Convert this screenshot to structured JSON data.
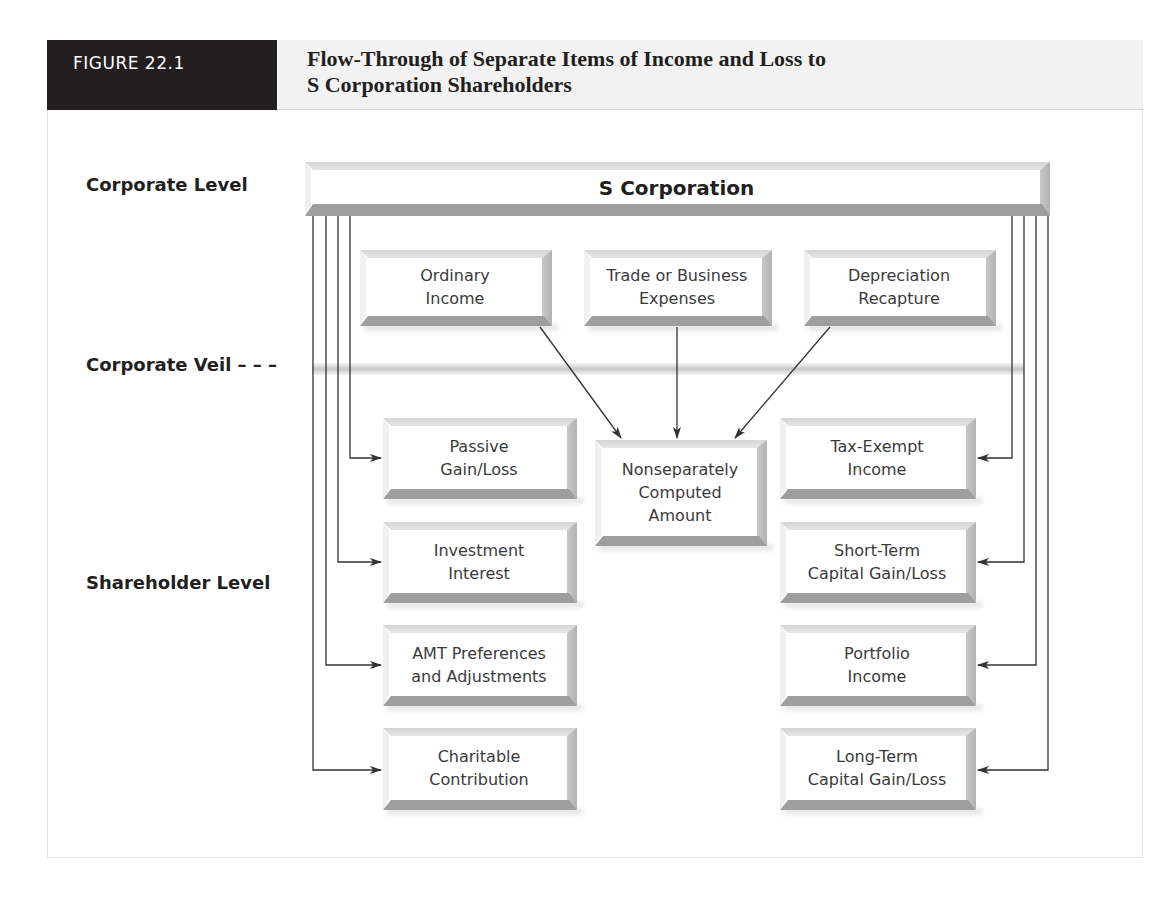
{
  "figure": {
    "label": "FIGURE 22.1",
    "title_line1": "Flow-Through of Separate Items of Income and Loss to",
    "title_line2": "S Corporation Shareholders"
  },
  "levels": {
    "corporate": "Corporate Level",
    "veil": "Corporate Veil – – –",
    "shareholder": "Shareholder Level"
  },
  "corporation": {
    "label": "S Corporation"
  },
  "top_items": [
    {
      "line1": "Ordinary",
      "line2": "Income"
    },
    {
      "line1": "Trade or Business",
      "line2": "Expenses"
    },
    {
      "line1": "Depreciation",
      "line2": "Recapture"
    }
  ],
  "center_item": {
    "line1": "Nonseparately",
    "line2": "Computed",
    "line3": "Amount"
  },
  "left_items": [
    {
      "line1": "Passive",
      "line2": "Gain/Loss"
    },
    {
      "line1": "Investment",
      "line2": "Interest"
    },
    {
      "line1": "AMT Preferences",
      "line2": "and Adjustments"
    },
    {
      "line1": "Charitable",
      "line2": "Contribution"
    }
  ],
  "right_items": [
    {
      "line1": "Tax-Exempt",
      "line2": "Income"
    },
    {
      "line1": "Short-Term",
      "line2": "Capital Gain/Loss"
    },
    {
      "line1": "Portfolio",
      "line2": "Income"
    },
    {
      "line1": "Long-Term",
      "line2": "Capital Gain/Loss"
    }
  ],
  "colors": {
    "header_dark": "#231f20",
    "header_light": "#f2f2f2",
    "line": "#333333",
    "bevel_dark": "#9e9e9e"
  }
}
